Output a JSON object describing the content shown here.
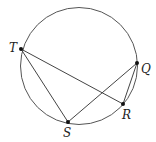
{
  "diagram": {
    "type": "circle-inscribed-chords",
    "circle": {
      "cx": 79,
      "cy": 66,
      "r": 58.5
    },
    "points": {
      "T": {
        "label": "T",
        "x": 21,
        "y": 49,
        "lx": 9,
        "ly": 52
      },
      "Q": {
        "label": "Q",
        "x": 137,
        "y": 63,
        "lx": 141,
        "ly": 73
      },
      "R": {
        "label": "R",
        "x": 123,
        "y": 104,
        "lx": 122,
        "ly": 119
      },
      "S": {
        "label": "S",
        "x": 68,
        "y": 122,
        "lx": 63,
        "ly": 137
      }
    },
    "segments": [
      "TS",
      "TR",
      "SQ",
      "QR"
    ],
    "stroke_color": "#444444",
    "point_color": "#111111"
  }
}
